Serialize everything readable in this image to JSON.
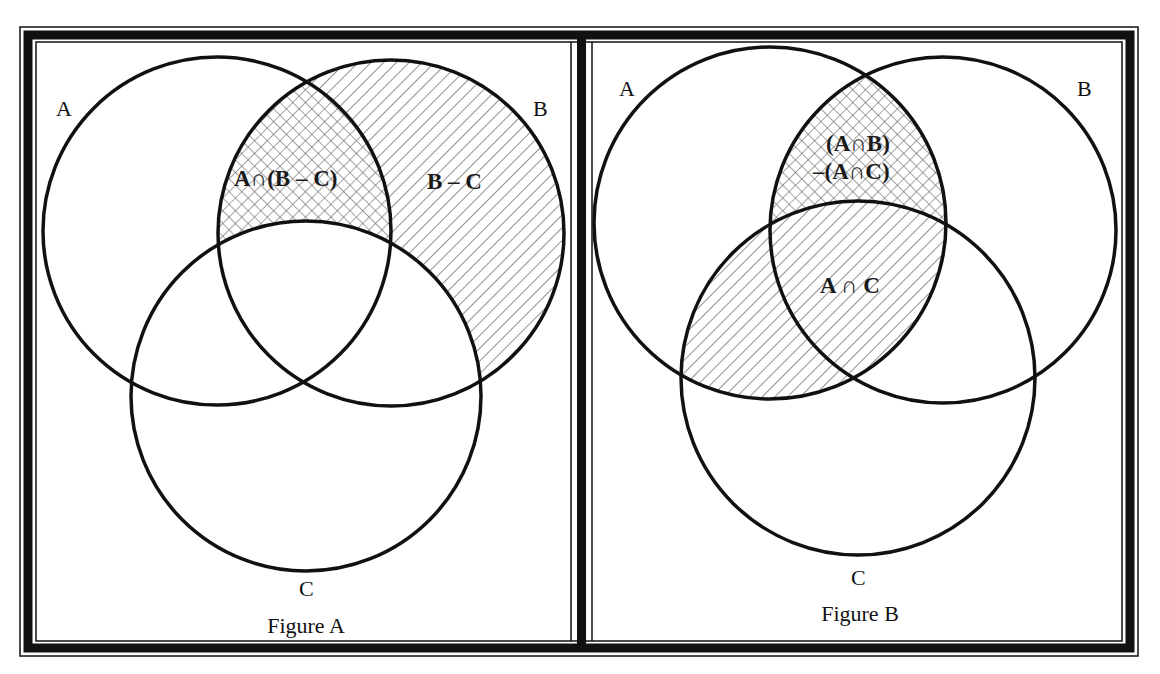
{
  "figures": [
    {
      "caption": "Figure A",
      "set_labels": {
        "A": "A",
        "B": "B",
        "C": "C"
      },
      "region_labels": [
        {
          "text": "A∩(B – C)",
          "pattern": "crosshatch",
          "description": "A intersect (B minus C)"
        },
        {
          "text": "B – C",
          "pattern": "diagonal-hatch",
          "description": "B minus C"
        }
      ]
    },
    {
      "caption": "Figure B",
      "set_labels": {
        "A": "A",
        "B": "B",
        "C": "C"
      },
      "region_labels": [
        {
          "text_line1": "(A∩B)",
          "text_line2": "–(A∩C)",
          "pattern": "crosshatch",
          "description": "(A intersect B) minus (A intersect C)"
        },
        {
          "text": "A ∩ C",
          "pattern": "diagonal-hatch",
          "description": "A intersect C"
        }
      ]
    }
  ],
  "colors": {
    "stroke": "#111111",
    "hatch": "#555555",
    "background": "#ffffff",
    "frame": "#111111"
  }
}
